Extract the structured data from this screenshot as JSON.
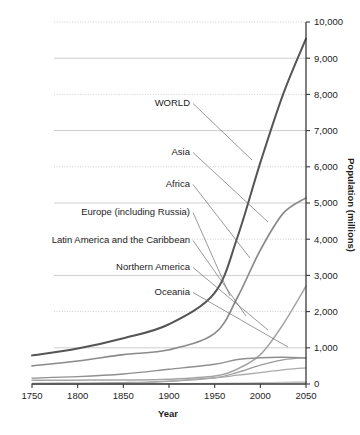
{
  "chart_data": {
    "type": "line",
    "title": "",
    "xlabel": "Year",
    "ylabel": "Population (millions)",
    "xlim": [
      1750,
      2050
    ],
    "ylim": [
      0,
      10000
    ],
    "grid": true,
    "legend_position": "inline-labels-with-leader-lines",
    "x_ticks": [
      1750,
      1800,
      1850,
      1900,
      1950,
      2000,
      2050
    ],
    "x_tick_labels": [
      "1750",
      "1800",
      "1850",
      "1900",
      "1950",
      "2000",
      "2050"
    ],
    "y_ticks": [
      0,
      1000,
      2000,
      3000,
      4000,
      5000,
      6000,
      7000,
      8000,
      9000,
      10000
    ],
    "y_tick_labels": [
      "0",
      "1,000",
      "2,000",
      "3,000",
      "4,000",
      "5,000",
      "6,000",
      "7,000",
      "8,000",
      "9,000",
      "10,000"
    ],
    "x": [
      1750,
      1800,
      1850,
      1900,
      1950,
      1975,
      2000,
      2025,
      2050
    ],
    "series": [
      {
        "name": "WORLD",
        "color": "#555555",
        "width": 2.0,
        "values": [
          791,
          978,
          1262,
          1650,
          2519,
          4061,
          6115,
          8010,
          9540
        ]
      },
      {
        "name": "Asia",
        "color": "#8a8a8a",
        "width": 1.7,
        "values": [
          502,
          635,
          809,
          947,
          1398,
          2397,
          3698,
          4712,
          5142
        ]
      },
      {
        "name": "Africa",
        "color": "#a5a5a5",
        "width": 1.5,
        "values": [
          106,
          107,
          111,
          133,
          221,
          416,
          811,
          1650,
          2700
        ]
      },
      {
        "name": "Europe (including Russia)",
        "color": "#8f8f8f",
        "width": 1.4,
        "values": [
          163,
          203,
          276,
          408,
          547,
          676,
          727,
          739,
          720
        ]
      },
      {
        "name": "Latin America and the Caribbean",
        "color": "#9a9a9a",
        "width": 1.3,
        "values": [
          16,
          24,
          38,
          74,
          167,
          322,
          521,
          669,
          729
        ]
      },
      {
        "name": "Northern America",
        "color": "#aaaaaa",
        "width": 1.3,
        "values": [
          2,
          7,
          26,
          82,
          172,
          243,
          314,
          392,
          448
        ]
      },
      {
        "name": "Oceania",
        "color": "#c2c2c2",
        "width": 1.6,
        "values": [
          2,
          2,
          2,
          6,
          13,
          21,
          31,
          42,
          51
        ]
      }
    ],
    "annotations": [
      {
        "label": "WORLD",
        "label_x": 190,
        "label_y": 106,
        "leader_to_x": 252,
        "leader_to_y": 160
      },
      {
        "label": "Asia",
        "label_x": 190,
        "label_y": 155,
        "leader_to_x": 268,
        "leader_to_y": 222
      },
      {
        "label": "Africa",
        "label_x": 190,
        "label_y": 187,
        "leader_to_x": 250,
        "leader_to_y": 258
      },
      {
        "label": "Europe (including Russia)",
        "label_x": 190,
        "label_y": 215,
        "leader_to_x": 230,
        "leader_to_y": 296
      },
      {
        "label": "Latin America and the Caribbean",
        "label_x": 190,
        "label_y": 243,
        "leader_to_x": 246,
        "leader_to_y": 316
      },
      {
        "label": "Northern America",
        "label_x": 190,
        "label_y": 270,
        "leader_to_x": 268,
        "leader_to_y": 330
      },
      {
        "label": "Oceania",
        "label_x": 190,
        "label_y": 295,
        "leader_to_x": 288,
        "leader_to_y": 347
      }
    ]
  }
}
